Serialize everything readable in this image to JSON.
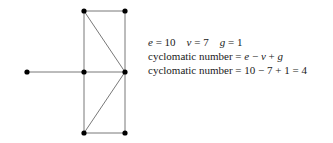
{
  "graph": {
    "nodes": [
      {
        "id": "a",
        "x": 27,
        "y": 72
      },
      {
        "id": "b",
        "x": 84,
        "y": 11
      },
      {
        "id": "c",
        "x": 125,
        "y": 11
      },
      {
        "id": "d",
        "x": 84,
        "y": 72
      },
      {
        "id": "e",
        "x": 125,
        "y": 72
      },
      {
        "id": "f",
        "x": 84,
        "y": 133
      },
      {
        "id": "g",
        "x": 125,
        "y": 133
      }
    ],
    "edges": [
      [
        "a",
        "d"
      ],
      [
        "b",
        "c"
      ],
      [
        "b",
        "d"
      ],
      [
        "d",
        "f"
      ],
      [
        "c",
        "e"
      ],
      [
        "e",
        "g"
      ],
      [
        "d",
        "e"
      ],
      [
        "f",
        "g"
      ],
      [
        "b",
        "e"
      ],
      [
        "e",
        "f"
      ]
    ]
  },
  "text": {
    "line1": {
      "e_label": "e",
      "e_val": " = 10",
      "v_label": "v",
      "v_val": " = 7",
      "g_label": "g",
      "g_val": " = 1"
    },
    "line2": {
      "prefix": "cyclomatic number = ",
      "e": "e",
      "minus": " − ",
      "v": "v",
      "plus": " + ",
      "g": "g"
    },
    "line3": "cyclomatic number = 10 − 7 + 1 = 4"
  }
}
